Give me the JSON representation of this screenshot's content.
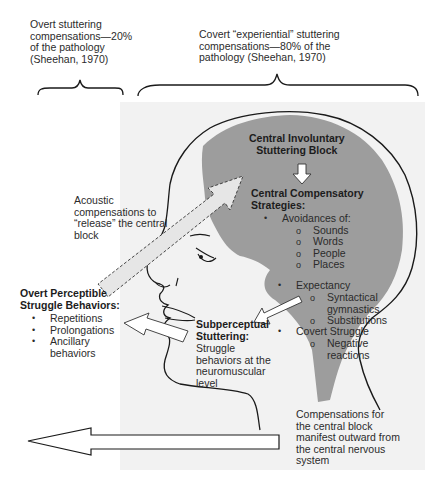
{
  "colors": {
    "brain_fill": "#9d9d9d",
    "background_shade": "#f2f2f2",
    "outline": "#1a1a1a",
    "arrow_fill": "#ffffff",
    "arrow_fill_light": "#d8d8d8",
    "text": "#2b2b2b"
  },
  "top_labels": {
    "overt": [
      "Overt stuttering",
      "compensations—20%",
      "of the pathology",
      "(Sheehan, 1970)"
    ],
    "covert": [
      "Covert “experiential” stuttering",
      "compensations—80% of the",
      "pathology (Sheehan, 1970)"
    ]
  },
  "central_block": {
    "title": [
      "Central Involuntary",
      "Stuttering Block"
    ]
  },
  "central_strategies": {
    "title": [
      "Central Compensatory",
      "Strategies:"
    ],
    "items": [
      {
        "label": "Avoidances of:",
        "subitems": [
          "Sounds",
          "Words",
          "People",
          "Places"
        ]
      },
      {
        "label": "Expectancy",
        "subitems": [
          "Syntactical gymnastics",
          "Substitutions"
        ]
      },
      {
        "label": "Covert Struggle",
        "subitems": [
          "Negative reactions"
        ]
      }
    ]
  },
  "acoustic": {
    "lines": [
      "Acoustic",
      "compensations to",
      "“release” the central",
      "block"
    ]
  },
  "overt_behaviors": {
    "title": [
      "Overt Perceptible",
      "Struggle Behaviors:"
    ],
    "items": [
      "Repetitions",
      "Prolongations",
      "Ancillary behaviors"
    ]
  },
  "subperceptual": {
    "title": [
      "Subperceptual",
      "Stuttering:"
    ],
    "lines": [
      "Struggle",
      "behaviors at the",
      "neuromuscular",
      "level"
    ]
  },
  "compensations_note": {
    "lines": [
      "Compensations for",
      "the central block",
      "manifest outward from",
      "the central nervous",
      "system"
    ]
  }
}
